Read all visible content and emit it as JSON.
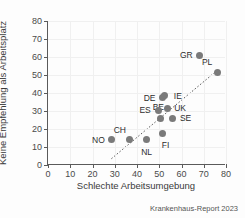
{
  "chart_data": {
    "type": "scatter",
    "title": "",
    "xlabel": "Schlechte Arbeitsumgebung",
    "ylabel": "Keine Empfehlung als Arbeitsplatz",
    "xlim": [
      0,
      80
    ],
    "ylim": [
      0,
      80
    ],
    "xticks": [
      0,
      10,
      20,
      30,
      40,
      50,
      60,
      70,
      80
    ],
    "yticks": [
      0,
      10,
      20,
      30,
      40,
      50,
      60,
      70,
      80
    ],
    "grid": true,
    "legend": "none",
    "point_color": "#7a7a7a",
    "axis_color": "#5a5a5a",
    "trendline": {
      "style": "dotted",
      "x_start": 28.5,
      "y_start": 3.5,
      "x_end": 76.0,
      "y_end": 52.5
    },
    "points": [
      {
        "label": "NO",
        "x": 28.5,
        "y": 14.0,
        "label_pos": "left"
      },
      {
        "label": "CH",
        "x": 36.8,
        "y": 14.0,
        "label_pos": "above-left"
      },
      {
        "label": "NL",
        "x": 44.3,
        "y": 14.0,
        "label_pos": "below"
      },
      {
        "label": "FI",
        "x": 51.5,
        "y": 17.5,
        "label_pos": "below-right"
      },
      {
        "label": "BE",
        "x": 50.5,
        "y": 26.0,
        "label_pos": "below-left"
      },
      {
        "label": "ES",
        "x": 49.5,
        "y": 30.5,
        "label_pos": "left"
      },
      {
        "label": "UK",
        "x": 53.5,
        "y": 31.5,
        "label_pos": "right"
      },
      {
        "label": "SE",
        "x": 56.0,
        "y": 26.0,
        "label_pos": "right"
      },
      {
        "label": "DE",
        "x": 51.5,
        "y": 37.5,
        "label_pos": "left"
      },
      {
        "label": "IE",
        "x": 52.5,
        "y": 38.5,
        "label_pos": "right"
      },
      {
        "label": "GR",
        "x": 68.0,
        "y": 61.0,
        "label_pos": "left"
      },
      {
        "label": "PL",
        "x": 76.0,
        "y": 51.5,
        "label_pos": "above-left"
      }
    ]
  },
  "caption": "Krankenhaus-Report 2023"
}
